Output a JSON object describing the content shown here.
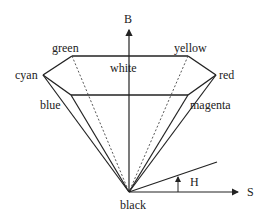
{
  "diagram": {
    "axes": {
      "brightness_label": "B",
      "saturation_label": "S",
      "hue_label": "H"
    },
    "vertices": {
      "green": "green",
      "yellow": "yellow",
      "cyan": "cyan",
      "white": "white",
      "red": "red",
      "blue": "blue",
      "magenta": "magenta",
      "black": "black"
    },
    "colors": {
      "stroke": "#222222",
      "background": "#ffffff"
    }
  }
}
